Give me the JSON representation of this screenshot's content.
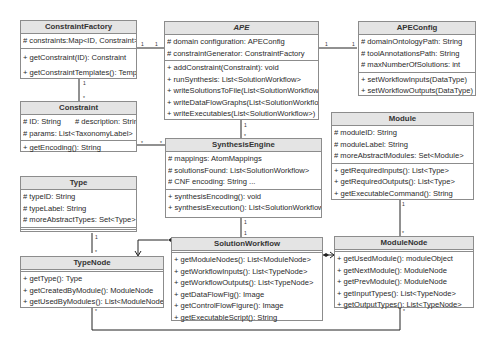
{
  "classes": {
    "constraint_factory": {
      "name": "ConstraintFactory",
      "attributes": [
        "# constraints:Map<ID, Constraint>"
      ],
      "methods": [
        "+ getConstraint(ID): Constraint",
        "+ getConstraintTemplates(): Templ"
      ]
    },
    "ape": {
      "name": "APE",
      "attributes": [
        "# domain configuration: APEConfig",
        "# constraintGenerator: ConstraintFactory"
      ],
      "methods": [
        "+ addConstraint(Constraint): void",
        "+ runSynthesis: List<SolutionWorkflow>",
        "+ writeSolutionsToFile(List<SolutionWorkflow>)",
        "+ writeDataFlowGraphs(List<SolutionWorkflow>)",
        "+ writeExecutables(List<SolutionWorkflow>)"
      ]
    },
    "ape_config": {
      "name": "APEConfig",
      "attributes": [
        "# domainOntologyPath: String",
        "# toolAnnotationsPath: String",
        "# maxNumberOfSolutions: int"
      ],
      "methods": [
        "+ setWorkflowInputs(DataType)",
        "+ setWorkflowOutputs(DataType)"
      ]
    },
    "constraint": {
      "name": "Constraint",
      "attributes": [
        "# ID: String",
        "# description: String",
        "# params: List<TaxonomyLabel>"
      ],
      "methods": [
        "+ getEncoding(): String"
      ]
    },
    "synthesis_engine": {
      "name": "SynthesisEngine",
      "attributes": [
        "# mappings: AtomMappings",
        "# solutionsFound: List<SolutionWorkflow>",
        "# CNF encoding: String    ..."
      ],
      "methods": [
        "+ synthesisEncoding(): void",
        "+ synthesisExecution(): List<SolutionWorkflow>"
      ]
    },
    "module": {
      "name": "Module",
      "attributes": [
        "# moduleID: String",
        "# moduleLabel: String",
        "# moreAbstractModules: Set<Module>"
      ],
      "methods": [
        "+ getRequiredInputs(): List<Type>",
        "+ getRequiredOutputs(): List<Type>",
        "+ getExecutableCommand(): String"
      ]
    },
    "type": {
      "name": "Type",
      "attributes": [
        "# typeID: String",
        "# typeLabel: String",
        "# moreAbstractTypes: Set<Type>"
      ],
      "methods": []
    },
    "type_node": {
      "name": "TypeNode",
      "attributes": [],
      "methods": [
        "+ getType(): Type",
        "+ getCreatedByModule(): ModuleNode",
        "+ getUsedByModules(): List<ModuleNode>"
      ]
    },
    "solution_workflow": {
      "name": "SolutionWorkflow",
      "attributes": [],
      "methods": [
        "+ getModuleNodes(): List<ModuleNode>",
        "+ getWorkflowInputs(): List<TypeNode>",
        "+ getWorkflowOutputs(): List<TypeNode>",
        "+ getDataFlowFig(): Image",
        "+ getControlFlowFigure(): Image",
        "+ getExecutableScript(): String"
      ]
    },
    "module_node": {
      "name": "ModuleNode",
      "attributes": [],
      "methods": [
        "+ getUsedModule(): moduleObject",
        "+ getNextModule(): ModuleNode",
        "+ getPrevModule(): ModuleNode",
        "+ getInputTypes(): List<TypeNode>",
        "+ getOutputTypes(): List<TypeNode>"
      ]
    }
  },
  "multiplicities": {
    "cf_ape_left": "1",
    "cf_ape_right": "1",
    "ape_cfg_left": "1",
    "ape_cfg_right": "1",
    "cf_con_top": "1",
    "cf_con_bottom": "*",
    "con_se_left": "*",
    "con_se_right": "*",
    "ape_se_top": "1",
    "ape_se_bottom": "*",
    "se_sw_top": "1",
    "se_sw_bottom": "1",
    "type_tn_top": "1",
    "type_tn_bottom": "*",
    "mod_mn_top": "1",
    "mod_mn_bottom": "*",
    "tn_loop": "*",
    "mn_loop": "*"
  }
}
